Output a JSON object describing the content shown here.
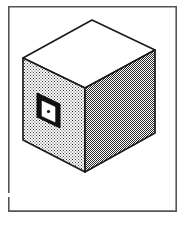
{
  "figure": {
    "title": "Isometric cube with shaded faces and aperture",
    "caption": "",
    "canvas": {
      "width": 184,
      "height": 225,
      "background": "#ffffff"
    },
    "border": {
      "name": "figure-border-frame",
      "x": 8,
      "y": 6,
      "width": 169,
      "height": 206,
      "stroke": "#555555",
      "stroke_width": 1.6,
      "fill": "none",
      "gap": {
        "present": true,
        "side": "left",
        "y": 193,
        "height": 4
      }
    },
    "colors": {
      "outline": "#1b1b1b",
      "top_face": "#ffffff",
      "left_face_base": "#ffffff",
      "left_face_stipple": "#3a3a3a",
      "right_face_base": "#ffffff",
      "right_face_hatch": "#2a2a2a",
      "aperture_frame": "#111111",
      "aperture_inner": "#ffffff",
      "aperture_dot": "#111111"
    },
    "cube": {
      "name": "isometric-cube",
      "vertices": {
        "top_apex": [
          92,
          20
        ],
        "top_left": [
          23,
          58
        ],
        "top_right": [
          155,
          50
        ],
        "front_top": [
          85,
          88
        ],
        "bottom_left": [
          23,
          140
        ],
        "bottom_front": [
          85,
          172
        ],
        "bottom_right": [
          155,
          133
        ]
      },
      "faces": [
        {
          "name": "cube-face-top",
          "label": "top face",
          "fill_style": "solid-white",
          "points": "92,20 23,58 85,88 155,50"
        },
        {
          "name": "cube-face-left",
          "label": "left face",
          "fill_style": "light-stipple",
          "points": "23,58 85,88 85,172 23,140"
        },
        {
          "name": "cube-face-right",
          "label": "right face",
          "fill_style": "dark-crosshatch",
          "points": "85,88 155,50 155,133 85,172"
        }
      ],
      "aperture": {
        "name": "cube-aperture-window",
        "label": "square aperture on left face",
        "outer_points": "37,93 60,104 60,128 37,117",
        "inner_points": "42,101 55,107 55,122 42,116",
        "dot": {
          "cx": 48.5,
          "cy": 111.5,
          "r": 1.6
        }
      }
    }
  }
}
